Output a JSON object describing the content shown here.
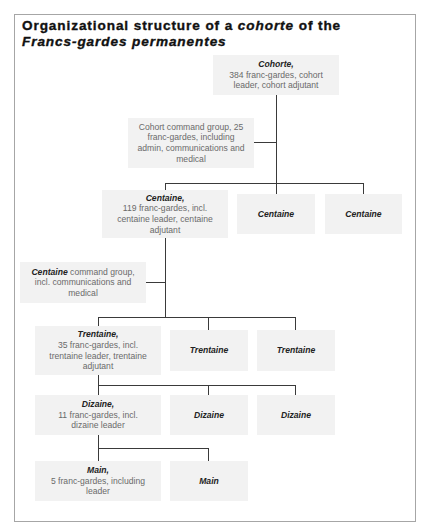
{
  "title": {
    "part1": "Organizational structure of a ",
    "italic1": "cohorte",
    "part2": " of the ",
    "italic2": "Francs-gardes permanentes"
  },
  "nodes": {
    "cohorte": {
      "head": "Cohorte,",
      "sub": "384 franc-gardes, cohort leader, cohort adjutant"
    },
    "cohort_command": {
      "text": "Cohort command group, 25 franc-gardes, including admin, communications and medical"
    },
    "centaine_main": {
      "head": "Centaine,",
      "sub": "119 franc-gardes, incl. centaine leader, centaine adjutant"
    },
    "centaine_2": {
      "head": "Centaine"
    },
    "centaine_3": {
      "head": "Centaine"
    },
    "centaine_command": {
      "head": "Centaine",
      "text": " command group, incl. communications and medical"
    },
    "trentaine_main": {
      "head": "Trentaine,",
      "sub": "35 franc-gardes, incl. trentaine leader, trentaine adjutant"
    },
    "trentaine_2": {
      "head": "Trentaine"
    },
    "trentaine_3": {
      "head": "Trentaine"
    },
    "dizaine_main": {
      "head": "Dizaine,",
      "sub": "11 franc-gardes, incl. dizaine leader"
    },
    "dizaine_2": {
      "head": "Dizaine"
    },
    "dizaine_3": {
      "head": "Dizaine"
    },
    "main_main": {
      "head": "Main,",
      "sub": "5 franc-gardes, including leader"
    },
    "main_2": {
      "head": "Main"
    }
  },
  "colors": {
    "box_fill": "#f2f2f2",
    "connector": "#3a3a3a",
    "frame": "#a6a6a6",
    "body_text": "#6a6a6a",
    "head_text": "#222222"
  }
}
